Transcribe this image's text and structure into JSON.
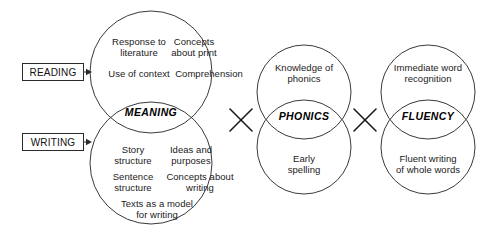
{
  "diagram": {
    "background": "#ffffff",
    "stroke_color": "#3a3a3a",
    "text_color": "#1a1a1a"
  },
  "side_labels": [
    {
      "id": "reading",
      "text": "READING",
      "x": 22,
      "y": 63,
      "w": 62,
      "h": 18,
      "arrow_to_x": 92
    },
    {
      "id": "writing",
      "text": "WRITING",
      "x": 22,
      "y": 133,
      "w": 62,
      "h": 18,
      "arrow_to_x": 92
    }
  ],
  "groups": [
    {
      "id": "meaning",
      "lens_label": "MEANING",
      "lens_x": 151,
      "lens_y": 113,
      "top_circle": {
        "cx": 151,
        "cy": 72,
        "r": 61
      },
      "bottom_circle": {
        "cx": 151,
        "cy": 163,
        "r": 61
      },
      "items": [
        {
          "id": "response-to-literature",
          "text": "Response to\nliterature",
          "x": 107,
          "y": 36,
          "w": 64
        },
        {
          "id": "concepts-about-print",
          "text": "Concepts\nabout print",
          "x": 162,
          "y": 36,
          "w": 64
        },
        {
          "id": "use-of-context",
          "text": "Use of context",
          "x": 103,
          "y": 68,
          "w": 72
        },
        {
          "id": "comprehension",
          "text": "Comprehension",
          "x": 170,
          "y": 68,
          "w": 78
        },
        {
          "id": "story-structure",
          "text": "Story\nstructure",
          "x": 104,
          "y": 144,
          "w": 58
        },
        {
          "id": "ideas-and-purposes",
          "text": "Ideas and\npurposes",
          "x": 160,
          "y": 144,
          "w": 62
        },
        {
          "id": "sentence-structure",
          "text": "Sentence\nstructure",
          "x": 104,
          "y": 171,
          "w": 58
        },
        {
          "id": "concepts-about-writing",
          "text": "Concepts about\nwriting",
          "x": 160,
          "y": 171,
          "w": 80
        },
        {
          "id": "texts-as-a-model-for-writing",
          "text": "Texts as a model\nfor writing",
          "x": 112,
          "y": 198,
          "w": 90
        }
      ]
    },
    {
      "id": "phonics",
      "lens_label": "PHONICS",
      "lens_x": 304,
      "lens_y": 117,
      "top_circle": {
        "cx": 304,
        "cy": 92,
        "r": 47
      },
      "bottom_circle": {
        "cx": 304,
        "cy": 147,
        "r": 47
      },
      "items": [
        {
          "id": "knowledge-of-phonics",
          "text": "Knowledge of\nphonics",
          "x": 264,
          "y": 62,
          "w": 80
        },
        {
          "id": "early-spelling",
          "text": "Early\nspelling",
          "x": 276,
          "y": 153,
          "w": 56
        }
      ]
    },
    {
      "id": "fluency",
      "lens_label": "FLUENCY",
      "lens_x": 428,
      "lens_y": 117,
      "top_circle": {
        "cx": 428,
        "cy": 92,
        "r": 47
      },
      "bottom_circle": {
        "cx": 428,
        "cy": 147,
        "r": 47
      },
      "items": [
        {
          "id": "immediate-word-recognition",
          "text": "Immediate word\nrecognition",
          "x": 385,
          "y": 62,
          "w": 86
        },
        {
          "id": "fluent-writing-of-whole-words",
          "text": "Fluent writing\nof whole words",
          "x": 387,
          "y": 153,
          "w": 82
        }
      ]
    }
  ],
  "operators": [
    {
      "id": "times-1",
      "symbol": "×",
      "cx": 241,
      "cy": 120,
      "size": 11
    },
    {
      "id": "times-2",
      "symbol": "×",
      "cx": 365,
      "cy": 120,
      "size": 11
    }
  ]
}
